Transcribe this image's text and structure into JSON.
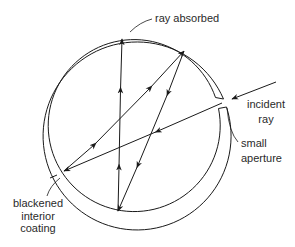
{
  "diagram": {
    "type": "blackbody-cavity-ray-diagram",
    "labels": {
      "ray_absorbed": "ray absorbed",
      "incident_ray_line1": "incident",
      "incident_ray_line2": "ray",
      "small_aperture_line1": "small",
      "small_aperture_line2": "aperture",
      "blackened_line1": "blackened",
      "blackened_line2": "interior",
      "blackened_line3": "coating"
    },
    "colors": {
      "stroke": "#1a1a1a",
      "text": "#2a2a2a",
      "background": "#ffffff"
    },
    "cavity": {
      "center": [
        136,
        125
      ],
      "outer_radius": 94,
      "inner_radius": 86
    },
    "ray_path": [
      {
        "from": "incident-start",
        "point": [
          276,
          82
        ]
      },
      {
        "from": "aperture",
        "point": [
          222,
          103
        ]
      },
      {
        "from": "reflection-1-left",
        "point": [
          64,
          171
        ]
      },
      {
        "from": "reflection-2-top-right",
        "point": [
          184,
          51
        ]
      },
      {
        "from": "reflection-3-bottom",
        "point": [
          118,
          211
        ]
      },
      {
        "from": "absorbed-top",
        "point": [
          122,
          39
        ]
      }
    ]
  }
}
